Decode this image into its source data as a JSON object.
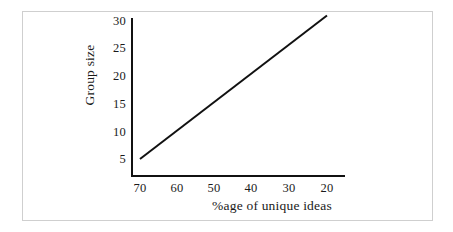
{
  "figure": {
    "border_color": "#cfcfcf",
    "axis_color": "#111111",
    "line_color": "#111111",
    "background": "#ffffff"
  },
  "chart_data": {
    "type": "line",
    "title": "",
    "subtitle": "",
    "xlabel": "%age of unique ideas",
    "ylabel": "Group size",
    "x_ticks": [
      "70",
      "60",
      "50",
      "40",
      "30",
      "20"
    ],
    "y_ticks": [
      "30",
      "25",
      "20",
      "15",
      "10",
      "5"
    ],
    "xlim": [
      75,
      15
    ],
    "ylim": [
      0,
      32
    ],
    "x_axis_inverted": true,
    "grid": false,
    "legend": null,
    "series": [
      {
        "name": "Group size vs %age of unique ideas",
        "x": [
          70,
          20
        ],
        "values": [
          5,
          31
        ],
        "color": "#111111",
        "style": "solid",
        "width": 2
      }
    ],
    "annotations": []
  }
}
